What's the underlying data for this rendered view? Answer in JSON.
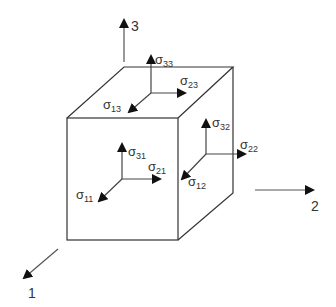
{
  "diagram": {
    "colors": {
      "line": "#333333",
      "arrow": "#111111",
      "background": "#ffffff"
    },
    "axes": [
      {
        "id": "axis-1",
        "label": "1"
      },
      {
        "id": "axis-2",
        "label": "2"
      },
      {
        "id": "axis-3",
        "label": "3"
      }
    ],
    "stress_labels": {
      "s33": {
        "symbol": "σ",
        "sub": "33"
      },
      "s23": {
        "symbol": "σ",
        "sub": "23"
      },
      "s13": {
        "symbol": "σ",
        "sub": "13"
      },
      "s32": {
        "symbol": "σ",
        "sub": "32"
      },
      "s22": {
        "symbol": "σ",
        "sub": "22"
      },
      "s12": {
        "symbol": "σ",
        "sub": "12"
      },
      "s31": {
        "symbol": "σ",
        "sub": "31"
      },
      "s21": {
        "symbol": "σ",
        "sub": "21"
      },
      "s11": {
        "symbol": "σ",
        "sub": "11"
      }
    },
    "faces": [
      {
        "name": "top-face",
        "normal": "3",
        "components": [
          "s33",
          "s23",
          "s13"
        ]
      },
      {
        "name": "right-face",
        "normal": "2",
        "components": [
          "s32",
          "s22",
          "s12"
        ]
      },
      {
        "name": "front-face",
        "normal": "1",
        "components": [
          "s31",
          "s21",
          "s11"
        ]
      }
    ]
  }
}
